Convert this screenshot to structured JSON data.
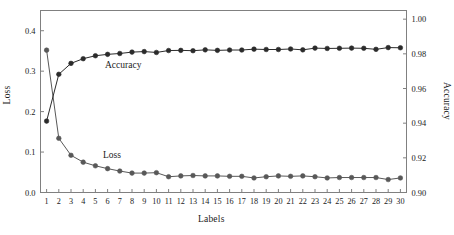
{
  "chart_data": {
    "type": "line",
    "title": "",
    "xlabel": "Labels",
    "ylabel": "Loss",
    "y2label": "Accuracy",
    "grid": false,
    "legend": "inline-annotations",
    "x": [
      1,
      2,
      3,
      4,
      5,
      6,
      7,
      8,
      9,
      10,
      11,
      12,
      13,
      14,
      15,
      16,
      17,
      18,
      19,
      20,
      21,
      22,
      23,
      24,
      25,
      26,
      27,
      28,
      29,
      30
    ],
    "xlim": [
      0.5,
      30.5
    ],
    "ylim": [
      0.0,
      0.45
    ],
    "y2lim": [
      0.9,
      1.005
    ],
    "yticks": [
      "0.0",
      "0.1",
      "0.2",
      "0.3",
      "0.4"
    ],
    "ytick_values": [
      0.0,
      0.1,
      0.2,
      0.3,
      0.4
    ],
    "y2ticks": [
      "0.90",
      "0.92",
      "0.94",
      "0.96",
      "0.98",
      "1.00"
    ],
    "y2tick_values": [
      0.9,
      0.92,
      0.94,
      0.96,
      0.98,
      1.0
    ],
    "xticks": [
      "1",
      "2",
      "3",
      "4",
      "5",
      "6",
      "7",
      "8",
      "9",
      "10",
      "11",
      "12",
      "13",
      "14",
      "15",
      "16",
      "17",
      "18",
      "19",
      "20",
      "21",
      "22",
      "23",
      "24",
      "25",
      "26",
      "27",
      "28",
      "29",
      "30"
    ],
    "series": [
      {
        "name": "Loss",
        "axis": "left",
        "color": "#585858",
        "marker": "circle",
        "label_text": "Loss",
        "values": [
          0.352,
          0.134,
          0.092,
          0.075,
          0.066,
          0.059,
          0.053,
          0.048,
          0.048,
          0.049,
          0.039,
          0.041,
          0.042,
          0.041,
          0.041,
          0.04,
          0.04,
          0.036,
          0.039,
          0.041,
          0.04,
          0.041,
          0.039,
          0.036,
          0.037,
          0.037,
          0.037,
          0.037,
          0.032,
          0.036
        ]
      },
      {
        "name": "Accuracy",
        "axis": "right",
        "color": "#2b2b2b",
        "marker": "circle",
        "label_text": "Accuracy",
        "values": [
          0.9412,
          0.9682,
          0.9745,
          0.9772,
          0.9789,
          0.9797,
          0.9802,
          0.981,
          0.9813,
          0.9808,
          0.9819,
          0.982,
          0.9818,
          0.9823,
          0.982,
          0.9822,
          0.9822,
          0.9827,
          0.9825,
          0.9825,
          0.9828,
          0.9823,
          0.9833,
          0.9831,
          0.9832,
          0.9833,
          0.9832,
          0.9826,
          0.9836,
          0.9835
        ]
      }
    ]
  },
  "axes": {
    "left_title": "Loss",
    "right_title": "Accuracy",
    "bottom_title": "Labels"
  },
  "annotations": {
    "accuracy": "Accuracy",
    "loss": "Loss"
  },
  "colors": {
    "frame": "#808080",
    "loss_series": "#585858",
    "accuracy_series": "#2b2b2b",
    "background": "#ffffff"
  }
}
